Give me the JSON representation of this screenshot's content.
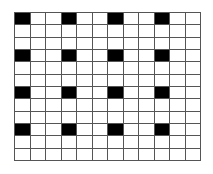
{
  "grid": {
    "rows": 12,
    "cols": 12,
    "filled_color": "#000000",
    "empty_color": "#ffffff",
    "line_color": "#555555",
    "filled_cells": [
      [
        0,
        0
      ],
      [
        0,
        3
      ],
      [
        0,
        6
      ],
      [
        0,
        9
      ],
      [
        3,
        0
      ],
      [
        3,
        3
      ],
      [
        3,
        6
      ],
      [
        3,
        9
      ],
      [
        6,
        0
      ],
      [
        6,
        3
      ],
      [
        6,
        6
      ],
      [
        6,
        9
      ],
      [
        9,
        0
      ],
      [
        9,
        3
      ],
      [
        9,
        6
      ],
      [
        9,
        9
      ]
    ]
  }
}
